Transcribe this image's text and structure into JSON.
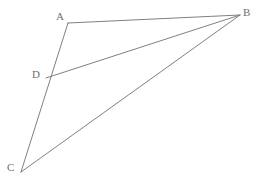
{
  "figure": {
    "background_color": "#ffffff",
    "stroke_color": "#808080",
    "label_color": "#6f6f6f",
    "stroke_width": 1,
    "canvas": {
      "width": 263,
      "height": 187
    },
    "points": [
      {
        "name": "A",
        "label": "A",
        "x": 68,
        "y": 23,
        "label_x": 56,
        "label_y": 11
      },
      {
        "name": "B",
        "label": "B",
        "x": 240,
        "y": 15,
        "label_x": 243,
        "label_y": 7
      },
      {
        "name": "C",
        "label": "C",
        "x": 21,
        "y": 172,
        "label_x": 7,
        "label_y": 162
      },
      {
        "name": "D",
        "label": "D",
        "x": 46,
        "y": 78,
        "label_x": 32,
        "label_y": 69
      }
    ],
    "segments": [
      {
        "name": "segment-AB",
        "from": "A",
        "to": "B",
        "x1": 68,
        "y1": 23,
        "x2": 240,
        "y2": 15
      },
      {
        "name": "segment-AC",
        "from": "A",
        "to": "C",
        "x1": 68,
        "y1": 23,
        "x2": 21,
        "y2": 172
      },
      {
        "name": "segment-DB",
        "from": "D",
        "to": "B",
        "x1": 46,
        "y1": 78,
        "x2": 240,
        "y2": 15
      },
      {
        "name": "segment-CB",
        "from": "C",
        "to": "B",
        "x1": 21,
        "y1": 172,
        "x2": 240,
        "y2": 15
      }
    ]
  }
}
